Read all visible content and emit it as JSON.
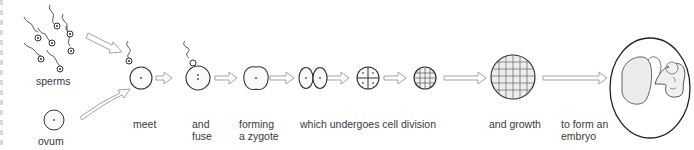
{
  "diagram": {
    "stages": [
      {
        "id": "sperms",
        "label": "sperms"
      },
      {
        "id": "ovum",
        "label": "ovum"
      },
      {
        "id": "meet",
        "label": "meet"
      },
      {
        "id": "fuse",
        "label_line1": "and",
        "label_line2": "fuse"
      },
      {
        "id": "zygote",
        "label_line1": "forming",
        "label_line2": "a zygote"
      },
      {
        "id": "cell-division",
        "label": "which undergoes cell division"
      },
      {
        "id": "growth",
        "label": "and growth"
      },
      {
        "id": "embryo",
        "label_line1": "to form an",
        "label_line2": "embryo"
      }
    ],
    "colors": {
      "stroke": "#333333",
      "arrow_fill": "#ffffff",
      "arrow_stroke": "#9a9a9a",
      "cell_fill": "#fafafa",
      "text": "#3a3a3a"
    }
  }
}
